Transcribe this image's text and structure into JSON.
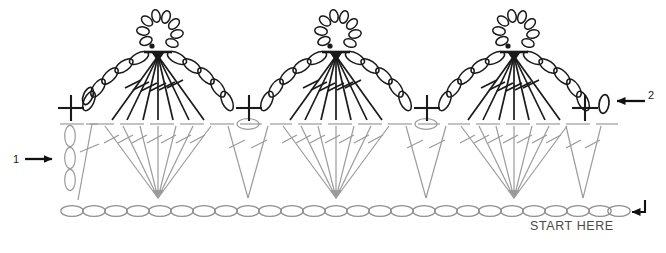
{
  "diagram": {
    "kind": "crochet-stitch-chart",
    "title": "",
    "colors": {
      "row2_dark": "#1a1a1a",
      "row1_gray": "#9b9b9b",
      "chain_gray": "#8f8f8f",
      "annotation": "#111111",
      "text": "#4a4a4a",
      "background": "#ffffff"
    },
    "annotations": [
      {
        "id": "callout-1",
        "label": "1",
        "arrow": "right",
        "x": 14,
        "y": 160
      },
      {
        "id": "callout-2",
        "label": "2",
        "arrow": "left",
        "x": 650,
        "y": 101
      },
      {
        "id": "start-here",
        "label": "START HERE",
        "arrow": "left-hook",
        "x": 530,
        "y": 228
      }
    ],
    "rows": [
      {
        "id": "foundation-chain",
        "name": "Foundation chain",
        "symbol": "chain-oval",
        "color": "#8f8f8f",
        "count": 26,
        "y": 211
      },
      {
        "id": "row-1",
        "name": "Row 1",
        "color": "#9b9b9b",
        "number": "1",
        "y_top": 124,
        "y_base": 205,
        "motifs": [
          "turning-chain-3",
          "dtr-fan-7",
          "v-stitch",
          "dtr-fan-7",
          "v-stitch",
          "dtr-fan-7",
          "v-stitch"
        ]
      },
      {
        "id": "row-2",
        "name": "Row 2",
        "color": "#1a1a1a",
        "number": "2",
        "y_top": 16,
        "y_base": 122,
        "motifs": [
          "chain-oval",
          "sc-plus",
          "tr-fan-7-with-picot-and-chain-arcs",
          "sc-plus",
          "tr-fan-7-with-picot-and-chain-arcs",
          "sc-plus",
          "tr-fan-7-with-picot-and-chain-arcs",
          "sc-plus",
          "chain-oval"
        ]
      }
    ],
    "motif_centers_x": [
      158,
      336,
      514
    ],
    "sc_plus_x": [
      70,
      248,
      426,
      583
    ],
    "v_stitch_x": [
      248,
      426,
      583
    ]
  }
}
